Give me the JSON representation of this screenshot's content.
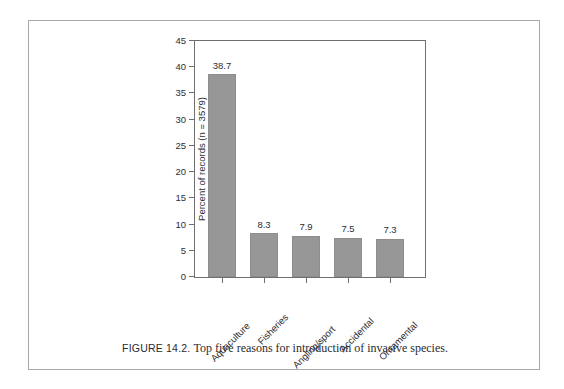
{
  "figure": {
    "caption_label": "FIGURE 14.2.",
    "caption_text": "Top five reasons for introduction of invasive species."
  },
  "chart_data": {
    "type": "bar",
    "title": "",
    "xlabel": "",
    "ylabel": "Percent of records (n = 3579)",
    "categories": [
      "Aquaculture",
      "Fisheries",
      "Angling/sport",
      "Accidental",
      "Ornamental"
    ],
    "values": [
      38.7,
      8.3,
      7.9,
      7.5,
      7.3
    ],
    "value_labels": [
      "38.7",
      "8.3",
      "7.9",
      "7.5",
      "7.3"
    ],
    "ylim": [
      0,
      45
    ],
    "ytick_values": [
      0,
      5,
      10,
      15,
      20,
      25,
      30,
      35,
      40,
      45
    ],
    "ytick_labels": [
      "0",
      "5",
      "10",
      "15",
      "20",
      "25",
      "30",
      "35",
      "40",
      "45"
    ],
    "grid": false,
    "legend": false,
    "bar_color": "#979797",
    "axis_color": "#6e6e73",
    "text_color": "#2e2e31"
  }
}
